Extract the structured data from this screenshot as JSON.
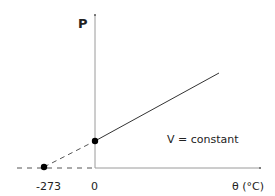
{
  "diagram": {
    "y_axis_label": "P",
    "x_axis_label": "θ (°C)",
    "x_ticks": [
      {
        "label": "-273",
        "value": -273
      },
      {
        "label": "0",
        "value": 0
      }
    ],
    "annotation": "V = constant",
    "points": [
      {
        "name": "intercept-zero",
        "theta": 0
      },
      {
        "name": "absolute-zero",
        "theta": -273
      }
    ],
    "colors": {
      "axis": "#999999",
      "line": "#333333",
      "point": "#000000",
      "text": "#222222"
    }
  }
}
